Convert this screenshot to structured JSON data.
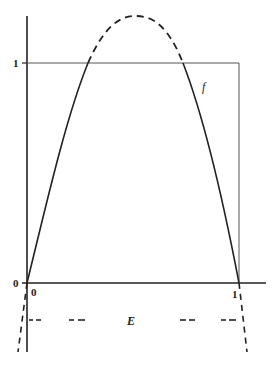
{
  "figure": {
    "y_ticks": [
      {
        "label": "1",
        "value": 1
      },
      {
        "label": "0",
        "value": 0
      }
    ],
    "x_ticks": [
      {
        "label": "0",
        "value": 0
      },
      {
        "label": "1",
        "value": 1
      }
    ],
    "curve_label": "f",
    "set_label": "E",
    "colors": {
      "ink": "#222222",
      "background": "#ffffff",
      "box": "#555555"
    }
  }
}
